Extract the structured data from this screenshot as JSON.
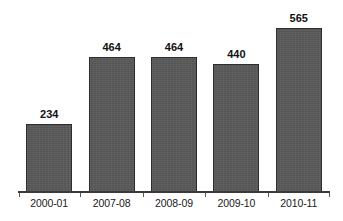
{
  "chart_data": {
    "type": "bar",
    "title": "",
    "subtitle": "",
    "xlabel": "",
    "ylabel": "",
    "categories": [
      "2000-01",
      "2007-08",
      "2008-09",
      "2009-10",
      "2010-11"
    ],
    "values": [
      234,
      464,
      464,
      440,
      565
    ],
    "data_labels": [
      "234",
      "464",
      "464",
      "440",
      "565"
    ],
    "ylim": [
      0,
      660
    ],
    "grid": false,
    "legend": false,
    "y_axis_visible": false,
    "x_axis_visible": true,
    "bar_color": "#585858",
    "bar_border_color": "#2e2e2e",
    "background_color": "#ffffff",
    "label_color": "#111111",
    "axis_color": "#3a3a3a"
  },
  "bars": [
    {
      "category": "2000-01",
      "value": 234,
      "label": "234"
    },
    {
      "category": "2007-08",
      "value": 464,
      "label": "464"
    },
    {
      "category": "2008-09",
      "value": 464,
      "label": "464"
    },
    {
      "category": "2009-10",
      "value": 440,
      "label": "440"
    },
    {
      "category": "2010-11",
      "value": 565,
      "label": "565"
    }
  ]
}
